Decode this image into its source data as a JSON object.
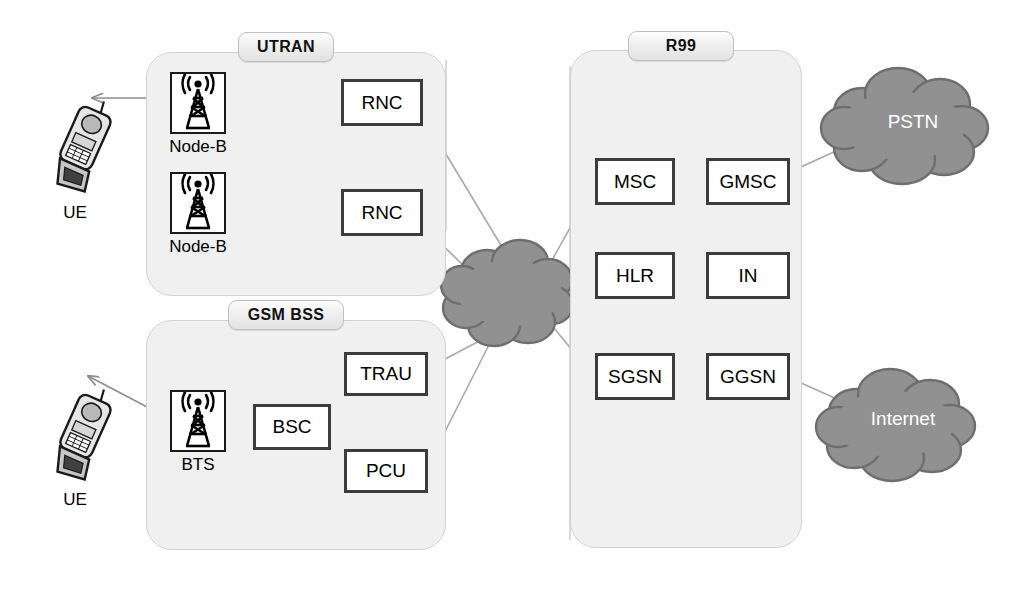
{
  "diagram": {
    "background": "#ffffff",
    "colors": {
      "group_fill": "#f0f0f0",
      "group_stroke": "#d2d2d2",
      "box_stroke": "#3c3c3c",
      "box_fill": "#ffffff",
      "cloud_fill": "#919191",
      "cloud_stroke": "#6a6a6a",
      "link_line": "#a9a9a9",
      "dashed_line": "#b5b5b5",
      "text": "#000000",
      "cloud_text": "#ffffff"
    }
  },
  "groups": [
    {
      "id": "utran",
      "label": "UTRAN",
      "x": 146,
      "y": 52,
      "w": 300,
      "h": 244,
      "pill_x": 238,
      "pill_y": 32,
      "pill_w": 96,
      "pill_h": 30
    },
    {
      "id": "gsm_bss",
      "label": "GSM BSS",
      "x": 146,
      "y": 320,
      "w": 300,
      "h": 230,
      "pill_x": 228,
      "pill_y": 300,
      "pill_w": 116,
      "pill_h": 30
    },
    {
      "id": "r99",
      "label": "R99",
      "x": 570,
      "y": 50,
      "w": 232,
      "h": 498,
      "pill_x": 628,
      "pill_y": 31,
      "pill_w": 106,
      "pill_h": 30
    }
  ],
  "nodes": [
    {
      "id": "rnc1",
      "label": "RNC",
      "x": 341,
      "y": 79,
      "w": 82,
      "h": 47
    },
    {
      "id": "rnc2",
      "label": "RNC",
      "x": 341,
      "y": 189,
      "w": 82,
      "h": 47
    },
    {
      "id": "trau",
      "label": "TRAU",
      "x": 344,
      "y": 352,
      "w": 84,
      "h": 44
    },
    {
      "id": "bsc",
      "label": "BSC",
      "x": 253,
      "y": 404,
      "w": 78,
      "h": 46
    },
    {
      "id": "pcu",
      "label": "PCU",
      "x": 344,
      "y": 449,
      "w": 84,
      "h": 44
    },
    {
      "id": "msc",
      "label": "MSC",
      "x": 595,
      "y": 158,
      "w": 80,
      "h": 47
    },
    {
      "id": "gmsc",
      "label": "GMSC",
      "x": 706,
      "y": 158,
      "w": 84,
      "h": 47
    },
    {
      "id": "hlr",
      "label": "HLR",
      "x": 595,
      "y": 252,
      "w": 80,
      "h": 47
    },
    {
      "id": "in",
      "label": "IN",
      "x": 706,
      "y": 252,
      "w": 84,
      "h": 47
    },
    {
      "id": "sgsn",
      "label": "SGSN",
      "x": 595,
      "y": 353,
      "w": 80,
      "h": 47
    },
    {
      "id": "ggsn",
      "label": "GGSN",
      "x": 706,
      "y": 353,
      "w": 84,
      "h": 47
    }
  ],
  "towers": [
    {
      "id": "nodeb1",
      "icon": "cell-tower-icon",
      "label": "Node-B",
      "x": 170,
      "y": 72,
      "w": 56,
      "h": 62,
      "label_x": 150,
      "label_y": 137,
      "label_w": 96
    },
    {
      "id": "nodeb2",
      "icon": "cell-tower-icon",
      "label": "Node-B",
      "x": 170,
      "y": 172,
      "w": 56,
      "h": 62,
      "label_x": 150,
      "label_y": 237,
      "label_w": 96
    },
    {
      "id": "bts",
      "icon": "cell-tower-icon",
      "label": "BTS",
      "x": 170,
      "y": 390,
      "w": 56,
      "h": 62,
      "label_x": 150,
      "label_y": 455,
      "label_w": 96
    }
  ],
  "handsets": [
    {
      "id": "ue_top",
      "icon": "mobile-handset-icon",
      "label": "UE",
      "x": 36,
      "y": 90,
      "w": 80,
      "h": 110,
      "label_x": 30,
      "label_y": 203,
      "label_w": 90
    },
    {
      "id": "ue_bottom",
      "icon": "mobile-handset-icon",
      "label": "UE",
      "x": 36,
      "y": 378,
      "w": 80,
      "h": 110,
      "label_x": 30,
      "label_y": 490,
      "label_w": 90
    }
  ],
  "clouds": [
    {
      "id": "core_cloud",
      "label": "",
      "cx": 513,
      "cy": 292,
      "rx": 58,
      "ry": 48,
      "label_x": 456,
      "label_y": 282,
      "label_w": 114
    },
    {
      "id": "pstn",
      "label": "PSTN",
      "cx": 913,
      "cy": 124,
      "rx": 78,
      "ry": 52,
      "label_x": 852,
      "label_y": 111,
      "label_w": 122
    },
    {
      "id": "internet",
      "label": "Internet",
      "cx": 903,
      "cy": 423,
      "rx": 75,
      "ry": 50,
      "label_x": 840,
      "label_y": 408,
      "label_w": 126
    }
  ],
  "air_links": [
    {
      "id": "ue-top-to-nodeb",
      "from": "ue_top",
      "to": "nodeb1",
      "style": "double-arrow",
      "x1": 92,
      "y1": 98,
      "x2": 172,
      "y2": 98
    },
    {
      "id": "ue-bottom-to-bts",
      "from": "ue_bottom",
      "to": "bts",
      "style": "double-arrow",
      "x1": 88,
      "y1": 378,
      "x2": 172,
      "y2": 420
    }
  ],
  "links": [
    {
      "id": "nodeb1-rnc1",
      "style": "solid"
    },
    {
      "id": "nodeb2-rnc2",
      "style": "solid"
    },
    {
      "id": "rnc1-rnc2",
      "style": "solid"
    },
    {
      "id": "rnc1-cloud",
      "style": "solid"
    },
    {
      "id": "rnc2-cloud",
      "style": "solid"
    },
    {
      "id": "bts-bsc",
      "style": "solid"
    },
    {
      "id": "bsc-trau",
      "style": "solid"
    },
    {
      "id": "bsc-pcu",
      "style": "solid"
    },
    {
      "id": "trau-cloud",
      "style": "solid"
    },
    {
      "id": "pcu-cloud",
      "style": "solid"
    },
    {
      "id": "cloud-msc",
      "style": "solid"
    },
    {
      "id": "cloud-sgsn",
      "style": "solid"
    },
    {
      "id": "msc-gmsc",
      "style": "solid"
    },
    {
      "id": "sgsn-ggsn",
      "style": "solid"
    },
    {
      "id": "gmsc-pstn",
      "style": "solid"
    },
    {
      "id": "ggsn-internet",
      "style": "solid"
    },
    {
      "id": "msc-hlr",
      "style": "dashed"
    },
    {
      "id": "msc-in",
      "style": "dashed"
    },
    {
      "id": "gmsc-hlr",
      "style": "dashed"
    },
    {
      "id": "gmsc-in",
      "style": "dashed"
    },
    {
      "id": "hlr-sgsn",
      "style": "dashed"
    },
    {
      "id": "hlr-ggsn",
      "style": "dashed"
    },
    {
      "id": "in-sgsn",
      "style": "dashed"
    },
    {
      "id": "in-ggsn",
      "style": "dashed"
    }
  ]
}
